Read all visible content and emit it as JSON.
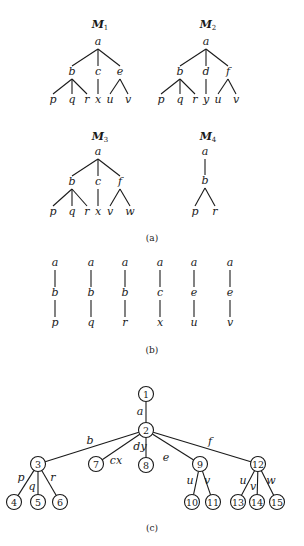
{
  "captions": {
    "a": "(a)",
    "b": "(b)",
    "c": "(c)"
  },
  "part_a": {
    "trees": [
      {
        "id": "M1",
        "title": "M",
        "subscript": "1",
        "titlePos": [
          100,
          28
        ],
        "nodes": [
          {
            "id": "a",
            "label": "a",
            "x": 98,
            "y": 45
          },
          {
            "id": "b",
            "label": "b",
            "x": 72,
            "y": 75
          },
          {
            "id": "c",
            "label": "c",
            "x": 98,
            "y": 75
          },
          {
            "id": "e",
            "label": "e",
            "x": 120,
            "y": 75
          },
          {
            "id": "p",
            "label": "p",
            "x": 53,
            "y": 103
          },
          {
            "id": "q",
            "label": "q",
            "x": 72,
            "y": 103
          },
          {
            "id": "r",
            "label": "r",
            "x": 87,
            "y": 103
          },
          {
            "id": "x",
            "label": "x",
            "x": 98,
            "y": 103
          },
          {
            "id": "u",
            "label": "u",
            "x": 110,
            "y": 103
          },
          {
            "id": "v",
            "label": "v",
            "x": 128,
            "y": 103
          }
        ],
        "edges": [
          [
            "a",
            "b"
          ],
          [
            "a",
            "c"
          ],
          [
            "a",
            "e"
          ],
          [
            "b",
            "p"
          ],
          [
            "b",
            "q"
          ],
          [
            "b",
            "r"
          ],
          [
            "c",
            "x"
          ],
          [
            "e",
            "u"
          ],
          [
            "e",
            "v"
          ]
        ]
      },
      {
        "id": "M2",
        "title": "M",
        "subscript": "2",
        "titlePos": [
          208,
          28
        ],
        "nodes": [
          {
            "id": "a",
            "label": "a",
            "x": 206,
            "y": 45
          },
          {
            "id": "b",
            "label": "b",
            "x": 180,
            "y": 75
          },
          {
            "id": "d",
            "label": "d",
            "x": 206,
            "y": 75
          },
          {
            "id": "f",
            "label": "f",
            "x": 228,
            "y": 75
          },
          {
            "id": "p",
            "label": "p",
            "x": 161,
            "y": 103
          },
          {
            "id": "q",
            "label": "q",
            "x": 180,
            "y": 103
          },
          {
            "id": "r",
            "label": "r",
            "x": 195,
            "y": 103
          },
          {
            "id": "y",
            "label": "y",
            "x": 206,
            "y": 103
          },
          {
            "id": "u",
            "label": "u",
            "x": 218,
            "y": 103
          },
          {
            "id": "v",
            "label": "v",
            "x": 236,
            "y": 103
          }
        ],
        "edges": [
          [
            "a",
            "b"
          ],
          [
            "a",
            "d"
          ],
          [
            "a",
            "f"
          ],
          [
            "b",
            "p"
          ],
          [
            "b",
            "q"
          ],
          [
            "b",
            "r"
          ],
          [
            "d",
            "y"
          ],
          [
            "f",
            "u"
          ],
          [
            "f",
            "v"
          ]
        ]
      },
      {
        "id": "M3",
        "title": "M",
        "subscript": "3",
        "titlePos": [
          100,
          140
        ],
        "nodes": [
          {
            "id": "a",
            "label": "a",
            "x": 98,
            "y": 155
          },
          {
            "id": "b",
            "label": "b",
            "x": 72,
            "y": 185
          },
          {
            "id": "c",
            "label": "c",
            "x": 98,
            "y": 185
          },
          {
            "id": "f",
            "label": "f",
            "x": 120,
            "y": 185
          },
          {
            "id": "p",
            "label": "p",
            "x": 53,
            "y": 215
          },
          {
            "id": "q",
            "label": "q",
            "x": 72,
            "y": 215
          },
          {
            "id": "r",
            "label": "r",
            "x": 87,
            "y": 215
          },
          {
            "id": "x",
            "label": "x",
            "x": 98,
            "y": 215
          },
          {
            "id": "v",
            "label": "v",
            "x": 110,
            "y": 215
          },
          {
            "id": "w",
            "label": "w",
            "x": 130,
            "y": 215
          }
        ],
        "edges": [
          [
            "a",
            "b"
          ],
          [
            "a",
            "c"
          ],
          [
            "a",
            "f"
          ],
          [
            "b",
            "p"
          ],
          [
            "b",
            "q"
          ],
          [
            "b",
            "r"
          ],
          [
            "c",
            "x"
          ],
          [
            "f",
            "v"
          ],
          [
            "f",
            "w"
          ]
        ]
      },
      {
        "id": "M4",
        "title": "M",
        "subscript": "4",
        "titlePos": [
          208,
          140
        ],
        "nodes": [
          {
            "id": "a",
            "label": "a",
            "x": 205,
            "y": 155
          },
          {
            "id": "b",
            "label": "b",
            "x": 205,
            "y": 184
          },
          {
            "id": "p",
            "label": "p",
            "x": 195,
            "y": 215
          },
          {
            "id": "r",
            "label": "r",
            "x": 215,
            "y": 215
          }
        ],
        "edges": [
          [
            "a",
            "b"
          ],
          [
            "b",
            "p"
          ],
          [
            "b",
            "r"
          ]
        ]
      }
    ]
  },
  "part_b": {
    "paths": [
      {
        "x": 55,
        "labels": [
          "a",
          "b",
          "p"
        ]
      },
      {
        "x": 91,
        "labels": [
          "a",
          "b",
          "q"
        ]
      },
      {
        "x": 125,
        "labels": [
          "a",
          "b",
          "r"
        ]
      },
      {
        "x": 160,
        "labels": [
          "a",
          "c",
          "x"
        ]
      },
      {
        "x": 194,
        "labels": [
          "a",
          "e",
          "u"
        ]
      },
      {
        "x": 230,
        "labels": [
          "a",
          "e",
          "v"
        ]
      }
    ],
    "rowY": [
      266,
      296,
      326
    ]
  },
  "part_c": {
    "radius": 7.5,
    "nodes": [
      {
        "id": "1",
        "label": "1",
        "x": 146,
        "y": 394
      },
      {
        "id": "2",
        "label": "2",
        "x": 146,
        "y": 430
      },
      {
        "id": "3",
        "label": "3",
        "x": 38,
        "y": 464
      },
      {
        "id": "7",
        "label": "7",
        "x": 96,
        "y": 464
      },
      {
        "id": "8",
        "label": "8",
        "x": 146,
        "y": 465
      },
      {
        "id": "9",
        "label": "9",
        "x": 200,
        "y": 464
      },
      {
        "id": "12",
        "label": "12",
        "x": 258,
        "y": 464
      },
      {
        "id": "4",
        "label": "4",
        "x": 14,
        "y": 502
      },
      {
        "id": "5",
        "label": "5",
        "x": 38,
        "y": 502
      },
      {
        "id": "6",
        "label": "6",
        "x": 60,
        "y": 502
      },
      {
        "id": "10",
        "label": "10",
        "x": 192,
        "y": 502
      },
      {
        "id": "11",
        "label": "11",
        "x": 213,
        "y": 502
      },
      {
        "id": "13",
        "label": "13",
        "x": 238,
        "y": 502
      },
      {
        "id": "14",
        "label": "14",
        "x": 257,
        "y": 502
      },
      {
        "id": "15",
        "label": "15",
        "x": 277,
        "y": 502
      }
    ],
    "edges": [
      {
        "from": "1",
        "to": "2",
        "label": "a",
        "lx": 140,
        "ly": 415
      },
      {
        "from": "2",
        "to": "3",
        "label": "b",
        "lx": 90,
        "ly": 444
      },
      {
        "from": "2",
        "to": "7",
        "label": "cx",
        "lx": 116,
        "ly": 464
      },
      {
        "from": "2",
        "to": "8",
        "label": "dy",
        "lx": 140,
        "ly": 450
      },
      {
        "from": "2",
        "to": "9",
        "label": "e",
        "lx": 166,
        "ly": 461
      },
      {
        "from": "2",
        "to": "12",
        "label": "f",
        "lx": 210,
        "ly": 445
      },
      {
        "from": "3",
        "to": "4",
        "label": "p",
        "lx": 21,
        "ly": 481
      },
      {
        "from": "3",
        "to": "5",
        "label": "q",
        "lx": 32,
        "ly": 490
      },
      {
        "from": "3",
        "to": "6",
        "label": "r",
        "lx": 53,
        "ly": 481
      },
      {
        "from": "9",
        "to": "10",
        "label": "u",
        "lx": 190,
        "ly": 484
      },
      {
        "from": "9",
        "to": "11",
        "label": "v",
        "lx": 207,
        "ly": 484
      },
      {
        "from": "12",
        "to": "13",
        "label": "u",
        "lx": 243,
        "ly": 484
      },
      {
        "from": "12",
        "to": "14",
        "label": "v",
        "lx": 253,
        "ly": 490
      },
      {
        "from": "12",
        "to": "15",
        "label": "w",
        "lx": 271,
        "ly": 484
      }
    ]
  }
}
